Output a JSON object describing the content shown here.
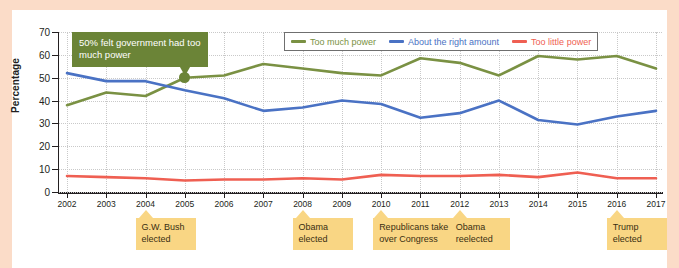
{
  "chart_data": {
    "type": "line",
    "title": "",
    "xlabel": "",
    "ylabel": "Percentage",
    "ylim": [
      0,
      70
    ],
    "ytick_step": 10,
    "grid": true,
    "legend_position": "top-right",
    "categories": [
      "2002",
      "2003",
      "2004",
      "2005",
      "2006",
      "2007",
      "2008",
      "2009",
      "2010",
      "2011",
      "2012",
      "2013",
      "2014",
      "2015",
      "2016",
      "2017"
    ],
    "series": [
      {
        "name": "Too much power",
        "color": "#7a9143",
        "values": [
          38,
          43.5,
          42,
          50,
          51,
          56,
          54,
          52,
          51,
          58.5,
          56.5,
          51,
          59.5,
          58,
          59.5,
          54
        ]
      },
      {
        "name": "About the right amount",
        "color": "#4a72c4",
        "values": [
          52,
          48.5,
          48.5,
          44.5,
          41,
          35.5,
          37,
          40,
          38.5,
          32.5,
          34.5,
          40,
          31.5,
          29.5,
          33,
          35.5
        ]
      },
      {
        "name": "Too little power",
        "color": "#ef5f52",
        "values": [
          7,
          6.5,
          6,
          5,
          5.5,
          5.5,
          6,
          5.5,
          7.5,
          7,
          7,
          7.5,
          6.5,
          8.5,
          6,
          6
        ]
      }
    ],
    "annotations": [
      {
        "text": "50% felt government had too much power",
        "year": "2005",
        "value": 50,
        "kind": "callout"
      },
      {
        "text": "G.W. Bush elected",
        "year": "2004",
        "kind": "event"
      },
      {
        "text": "Obama elected",
        "year": "2008",
        "kind": "event"
      },
      {
        "text": "Republicans take over Congress",
        "year": "2010",
        "kind": "event"
      },
      {
        "text": "Obama reelected",
        "year": "2012",
        "kind": "event"
      },
      {
        "text": "Trump elected",
        "year": "2016",
        "kind": "event"
      }
    ]
  },
  "yticks": [
    "0",
    "10",
    "20",
    "30",
    "40",
    "50",
    "60",
    "70"
  ],
  "legend": {
    "items": [
      {
        "label": "Too much power",
        "color": "#7a9143"
      },
      {
        "label": "About the right amount",
        "color": "#4a72c4"
      },
      {
        "label": "Too little power",
        "color": "#ef5f52"
      }
    ]
  },
  "callout": {
    "text": "50% felt government had too much power"
  },
  "notes": [
    {
      "label": "G.W. Bush\nelected",
      "year": "2004"
    },
    {
      "label": "Obama\nelected",
      "year": "2008"
    },
    {
      "label": "Republicans take\nover Congress",
      "year": "2010"
    },
    {
      "label": "Obama\nreelected",
      "year": "2012"
    },
    {
      "label": "Trump\nelected",
      "year": "2016"
    }
  ],
  "colors": {
    "page_background": "#fbdcc8",
    "card_background": "#ffffff",
    "axis": "#231f20",
    "grid": "#c9c9c9",
    "callout_background": "#6b8437",
    "note_background": "#f9d684"
  }
}
